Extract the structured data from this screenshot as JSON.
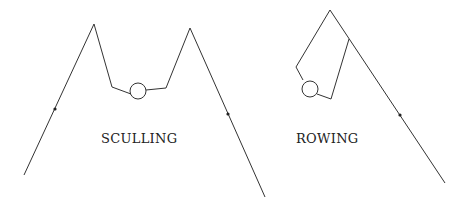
{
  "labels": {
    "sculling": "SCULLING",
    "rowing": "ROWING"
  },
  "colors": {
    "stroke": "#333333",
    "background": "#ffffff"
  },
  "diagrams": [
    {
      "name": "sculling",
      "description": "Two oars, one on each side of rower"
    },
    {
      "name": "rowing",
      "description": "One oar held with both hands on one side"
    }
  ]
}
